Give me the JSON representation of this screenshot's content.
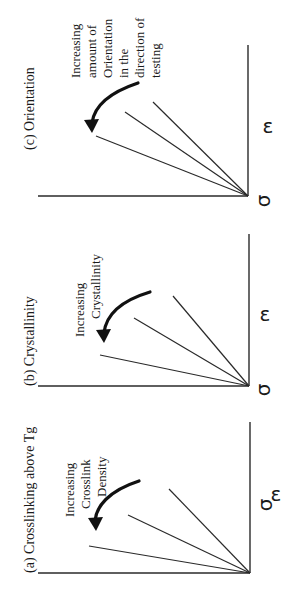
{
  "figure": {
    "orientation": "rotated 90 degrees counter-clockwise",
    "axis_labels": {
      "x": "ε",
      "y": "σ"
    },
    "panels": [
      {
        "id": "a",
        "title": "(a) Crosslinking above Tg",
        "annotation_lines": [
          "Increasing",
          "Crosslink",
          "Density"
        ],
        "curve_count": 3
      },
      {
        "id": "b",
        "title": "(b) Crystallinity",
        "annotation_lines": [
          "Increasing",
          "Crystallinity"
        ],
        "curve_count": 3
      },
      {
        "id": "c",
        "title": "(c) Orientation",
        "annotation_lines": [
          "Increasing",
          "amount of",
          "Orientation",
          "in the",
          "direction of",
          "testing"
        ],
        "curve_count": 3
      }
    ]
  },
  "colors": {
    "ink": "#1a1a1a",
    "background": "#ffffff"
  }
}
